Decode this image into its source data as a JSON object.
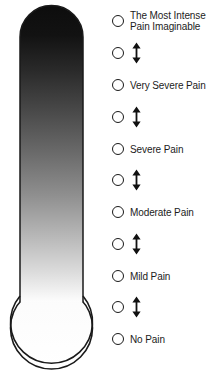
{
  "colors": {
    "ink": "#1c1c1c",
    "outline": "#1a1a1a",
    "gradient_top": "#111111",
    "gradient_bottom": "#ffffff",
    "background": "#ffffff"
  },
  "thermometer": {
    "name": "pain-thermometer",
    "description": "Vertical thermometer with rounded top, gradient from black at top to white at bottom, and an empty round bulb at the base",
    "column_top_label": "most intense",
    "column_bottom_label": "no pain",
    "bulb_filled": false
  },
  "scale": {
    "type": "ordinal-anchored-rating",
    "anchor_count": 6,
    "interval_count": 5,
    "total_options": 11,
    "arrow_glyph": "double-headed-vertical-arrow",
    "rows": [
      {
        "id": "most-intense",
        "kind": "anchor",
        "label": "The Most Intense\nPain Imaginable",
        "two_line": true,
        "y": 21
      },
      {
        "id": "interval-5",
        "kind": "interval",
        "label": "",
        "two_line": false,
        "y": 53
      },
      {
        "id": "very-severe",
        "kind": "anchor",
        "label": "Very Severe Pain",
        "two_line": false,
        "y": 85
      },
      {
        "id": "interval-4",
        "kind": "interval",
        "label": "",
        "two_line": false,
        "y": 117
      },
      {
        "id": "severe",
        "kind": "anchor",
        "label": "Severe Pain",
        "two_line": false,
        "y": 149
      },
      {
        "id": "interval-3",
        "kind": "interval",
        "label": "",
        "two_line": false,
        "y": 180
      },
      {
        "id": "moderate",
        "kind": "anchor",
        "label": "Moderate Pain",
        "two_line": false,
        "y": 212
      },
      {
        "id": "interval-2",
        "kind": "interval",
        "label": "",
        "two_line": false,
        "y": 244
      },
      {
        "id": "mild",
        "kind": "anchor",
        "label": "Mild Pain",
        "two_line": false,
        "y": 276
      },
      {
        "id": "interval-1",
        "kind": "interval",
        "label": "",
        "two_line": false,
        "y": 307
      },
      {
        "id": "slight",
        "kind": "anchor",
        "label": "Slight Pain",
        "two_line": false,
        "y": 308
      },
      {
        "id": "no-pain",
        "kind": "anchor",
        "label": "No Pain",
        "two_line": false,
        "y": 339
      }
    ],
    "ordered_rows": [
      {
        "id": "most-intense",
        "kind": "anchor",
        "label": "The Most Intense\nPain Imaginable",
        "two_line": true,
        "y": 21
      },
      {
        "id": "gap-5",
        "kind": "interval",
        "label": "",
        "two_line": false,
        "y": 53
      },
      {
        "id": "very-severe",
        "kind": "anchor",
        "label": "Very Severe Pain",
        "two_line": false,
        "y": 85
      },
      {
        "id": "gap-4",
        "kind": "interval",
        "label": "",
        "two_line": false,
        "y": 117
      },
      {
        "id": "severe",
        "kind": "anchor",
        "label": "Severe Pain",
        "two_line": false,
        "y": 149
      },
      {
        "id": "gap-3",
        "kind": "interval",
        "label": "",
        "two_line": false,
        "y": 180
      },
      {
        "id": "moderate",
        "kind": "anchor",
        "label": "Moderate Pain",
        "two_line": false,
        "y": 212
      },
      {
        "id": "gap-2",
        "kind": "interval",
        "label": "",
        "two_line": false,
        "y": 244
      },
      {
        "id": "mild",
        "kind": "anchor",
        "label": "Mild Pain",
        "two_line": false,
        "y": 276
      },
      {
        "id": "gap-1",
        "kind": "interval",
        "label": "",
        "two_line": false,
        "y": 307
      },
      {
        "id": "no-pain",
        "kind": "anchor",
        "label": "No Pain",
        "two_line": false,
        "y": 339
      }
    ]
  }
}
